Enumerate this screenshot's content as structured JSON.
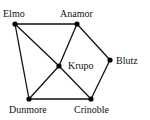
{
  "diagram": {
    "type": "graph",
    "nodes": [
      {
        "id": "elmo",
        "label": "Elmo",
        "x": 15,
        "y": 24,
        "lx": 3,
        "ly": 17
      },
      {
        "id": "anamor",
        "label": "Anamor",
        "x": 77,
        "y": 24,
        "lx": 60,
        "ly": 17
      },
      {
        "id": "krupo",
        "label": "Krupo",
        "x": 59,
        "y": 66,
        "lx": 68,
        "ly": 69
      },
      {
        "id": "blutz",
        "label": "Blutz",
        "x": 110,
        "y": 60,
        "lx": 116,
        "ly": 64
      },
      {
        "id": "dunmore",
        "label": "Dunmore",
        "x": 29,
        "y": 99,
        "lx": 9,
        "ly": 113
      },
      {
        "id": "crinoble",
        "label": "Crinoble",
        "x": 91,
        "y": 99,
        "lx": 74,
        "ly": 113
      }
    ],
    "edges": [
      [
        "elmo",
        "anamor"
      ],
      [
        "elmo",
        "dunmore"
      ],
      [
        "elmo",
        "krupo"
      ],
      [
        "krupo",
        "crinoble"
      ],
      [
        "anamor",
        "krupo"
      ],
      [
        "krupo",
        "dunmore"
      ],
      [
        "anamor",
        "blutz"
      ],
      [
        "blutz",
        "crinoble"
      ],
      [
        "dunmore",
        "crinoble"
      ]
    ]
  }
}
